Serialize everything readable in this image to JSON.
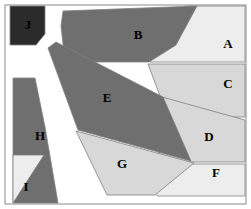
{
  "figure": {
    "name": "polygon-region-map",
    "width": 251,
    "height": 209,
    "background_color": "#FFFFFF",
    "border_color": "#8A8A8A",
    "gap_color": "#FFFFFF",
    "outline_color": "#808080"
  },
  "palette": {
    "dark_gray": "#6F6F6F",
    "light_gray": "#D8D8D8",
    "pale_gray": "#EDEDED",
    "near_black": "#2B2B2B",
    "white": "#FFFFFF"
  },
  "regions": [
    {
      "id": "A",
      "label": "A",
      "fill": "#EDEDED",
      "label_color": "#000000",
      "label_x": 228,
      "label_y": 45,
      "points": "185,6 245,6 245,62 150,62"
    },
    {
      "id": "B",
      "label": "B",
      "fill": "#6F6F6F",
      "label_color": "#000000",
      "label_x": 138,
      "label_y": 36,
      "points": "63,11 197,6 176,45 149,62 65,62 61,26"
    },
    {
      "id": "C",
      "label": "C",
      "fill": "#D8D8D8",
      "label_color": "#000000",
      "label_x": 228,
      "label_y": 85,
      "points": "148,64 245,64 245,117 204,117 160,96"
    },
    {
      "id": "D",
      "label": "D",
      "fill": "#D8D8D8",
      "label_color": "#000000",
      "label_x": 209,
      "label_y": 138,
      "points": "162,97 245,120 245,162 189,162 158,162"
    },
    {
      "id": "E",
      "label": "E",
      "fill": "#6F6F6F",
      "label_color": "#000000",
      "label_x": 107,
      "label_y": 99,
      "points": "56,42 48,48 78,130 191,161 163,97"
    },
    {
      "id": "F",
      "label": "F",
      "fill": "#EDEDED",
      "label_color": "#000000",
      "label_x": 216,
      "label_y": 174,
      "points": "108,164 245,164 245,196 158,196"
    },
    {
      "id": "G",
      "label": "G",
      "fill": "#D8D8D8",
      "label_color": "#000000",
      "label_x": 122,
      "label_y": 165,
      "points": "76,131 194,163 155,195 107,195"
    },
    {
      "id": "H",
      "label": "H",
      "fill": "#6F6F6F",
      "label_color": "#000000",
      "label_x": 40,
      "label_y": 137,
      "points": "13,78 35,78 45,127 58,203 13,203"
    },
    {
      "id": "I",
      "label": "I",
      "fill": "#EDEDED",
      "label_color": "#000000",
      "label_x": 26,
      "label_y": 188,
      "points": "13,155 44,155 13,203"
    },
    {
      "id": "J",
      "label": "J",
      "fill": "#2B2B2B",
      "label_color": "#FFFFFF",
      "label_x": 28,
      "label_y": 26,
      "points": "10,6 45,6 45,34 36,45 10,45"
    }
  ],
  "frame": {
    "x": 5,
    "y": 5,
    "width": 241,
    "height": 199
  }
}
